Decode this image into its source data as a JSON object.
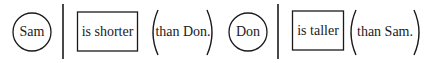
{
  "diagram": {
    "stroke_color": "#1a1a1a",
    "background": "#ffffff",
    "sentences": [
      {
        "subject": "Sam",
        "predicate": "is shorter",
        "complement": "(than Don.)",
        "complement_text": "than Don."
      },
      {
        "subject": "Don",
        "predicate": "is taller",
        "complement": "(than Sam.)",
        "complement_text": "than Sam."
      }
    ]
  }
}
